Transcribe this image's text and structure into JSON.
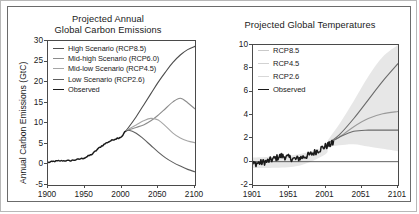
{
  "figure": {
    "border_color": "#6b6b6b",
    "outer_border_color": "#b8b8b8"
  },
  "chart_data": [
    {
      "type": "line",
      "panel": "left",
      "title_line1": "Projected Annual",
      "title_line2": "Global Carbon Emissions",
      "xlabel": "",
      "ylabel": "Annual Carbon Emissions (GtC)",
      "xlim": [
        1900,
        2100
      ],
      "ylim": [
        -5,
        30
      ],
      "xticks": [
        1900,
        1950,
        2000,
        2050,
        2100
      ],
      "xticklabels": [
        "1900",
        "1950",
        "2000",
        "2050",
        "2100"
      ],
      "yticks": [
        -5,
        0,
        5,
        10,
        15,
        20,
        25,
        30
      ],
      "yticklabels": [
        "-5",
        "0",
        "5",
        "10",
        "15",
        "20",
        "25",
        "30"
      ],
      "grid": false,
      "legend_position": "upper left",
      "series": [
        {
          "name": "High Scenario (RCP8.5)",
          "color": "#4d4d4d",
          "x": [
            2005,
            2010,
            2020,
            2030,
            2040,
            2050,
            2060,
            2070,
            2080,
            2090,
            2100
          ],
          "values": [
            8.0,
            9.1,
            11.6,
            14.4,
            17.2,
            20.0,
            22.5,
            24.8,
            26.6,
            27.9,
            28.7
          ]
        },
        {
          "name": "Mid-high Scenario (RCP6.0)",
          "color": "#8c8c8c",
          "x": [
            2005,
            2010,
            2020,
            2030,
            2040,
            2050,
            2060,
            2070,
            2080,
            2090,
            2100
          ],
          "values": [
            8.0,
            8.4,
            9.0,
            9.6,
            10.6,
            12.0,
            13.6,
            15.2,
            16.1,
            15.0,
            13.5
          ]
        },
        {
          "name": "Mid-low Scenario (RCP4.5)",
          "color": "#a6a6a6",
          "x": [
            2005,
            2010,
            2020,
            2030,
            2040,
            2050,
            2060,
            2070,
            2080,
            2090,
            2100
          ],
          "values": [
            8.0,
            8.6,
            9.6,
            10.6,
            11.2,
            10.8,
            9.3,
            7.6,
            6.4,
            5.7,
            5.3
          ]
        },
        {
          "name": "Low Scenario (RCP2.6)",
          "color": "#5f5f5f",
          "x": [
            2005,
            2010,
            2020,
            2030,
            2040,
            2050,
            2060,
            2070,
            2080,
            2090,
            2100
          ],
          "values": [
            8.0,
            8.3,
            7.6,
            6.2,
            4.6,
            3.0,
            1.6,
            0.5,
            -0.4,
            -1.2,
            -1.8
          ]
        },
        {
          "name": "Observed",
          "color": "#1a1a1a",
          "x": [
            1900,
            1910,
            1920,
            1930,
            1940,
            1950,
            1960,
            1970,
            1980,
            1990,
            2000,
            2005
          ],
          "values": [
            0.5,
            0.8,
            0.9,
            0.9,
            1.2,
            1.6,
            2.5,
            4.1,
            5.3,
            6.1,
            6.7,
            8.0
          ]
        }
      ]
    },
    {
      "type": "line",
      "panel": "right",
      "title_line1": "Projected Global Temperatures",
      "title_line2": "",
      "xlabel": "",
      "ylabel": "Temperature Change (°F)",
      "xlim": [
        1901,
        2101
      ],
      "ylim": [
        -2,
        10
      ],
      "xticks": [
        1901,
        1951,
        2001,
        2051,
        2101
      ],
      "xticklabels": [
        "1901",
        "1951",
        "2001",
        "2051",
        "2101"
      ],
      "yticks": [
        -2,
        0,
        2,
        4,
        6,
        8,
        10
      ],
      "yticklabels": [
        "-2",
        "0",
        "2",
        "4",
        "6",
        "8",
        "10"
      ],
      "grid": false,
      "legend_position": "upper left",
      "uncertainty_band": {
        "color": "#e3e3e3",
        "label": "range"
      },
      "series": [
        {
          "name": "RCP8.5",
          "color": "#6b6b6b",
          "x": [
            2005,
            2020,
            2040,
            2060,
            2080,
            2101
          ],
          "values": [
            1.6,
            2.3,
            3.7,
            5.3,
            6.9,
            8.4
          ]
        },
        {
          "name": "RCP4.5",
          "color": "#9a9a9a",
          "x": [
            2005,
            2020,
            2040,
            2060,
            2080,
            2101
          ],
          "values": [
            1.6,
            2.1,
            3.0,
            3.7,
            4.1,
            4.3
          ]
        },
        {
          "name": "RCP2.6",
          "color": "#6b6b6b",
          "x": [
            2005,
            2020,
            2040,
            2060,
            2080,
            2101
          ],
          "values": [
            1.6,
            2.1,
            2.6,
            2.7,
            2.7,
            2.7
          ]
        },
        {
          "name": "Observed",
          "color": "#1a1a1a",
          "x": [
            1901,
            1920,
            1940,
            1960,
            1980,
            2000,
            2012
          ],
          "values": [
            -0.2,
            0.0,
            0.5,
            0.2,
            0.6,
            1.3,
            1.6
          ]
        }
      ]
    }
  ],
  "left_panel": {
    "title_line1": "Projected Annual",
    "title_line2": "Global Carbon Emissions",
    "ylabel": "Annual Carbon Emissions (GtC)",
    "legend": [
      {
        "label": "High Scenario (RCP8.5)",
        "color": "#4d4d4d"
      },
      {
        "label": "Mid-high Scenario (RCP6.0)",
        "color": "#8c8c8c"
      },
      {
        "label": "Mid-low Scenario (RCP4.5)",
        "color": "#a6a6a6"
      },
      {
        "label": "Low Scenario (RCP2.6)",
        "color": "#5f5f5f"
      },
      {
        "label": "Observed",
        "color": "#1a1a1a"
      }
    ]
  },
  "right_panel": {
    "title_line1": "Projected Global Temperatures",
    "ylabel": "Temperature Change (°F)",
    "legend": [
      {
        "label": "RCP8.5",
        "color": "#c9c9c9"
      },
      {
        "label": "RCP4.5",
        "color": "#d2d2d2"
      },
      {
        "label": "RCP2.6",
        "color": "#d8d8d8"
      },
      {
        "label": "Observed",
        "color": "#1a1a1a"
      }
    ]
  }
}
